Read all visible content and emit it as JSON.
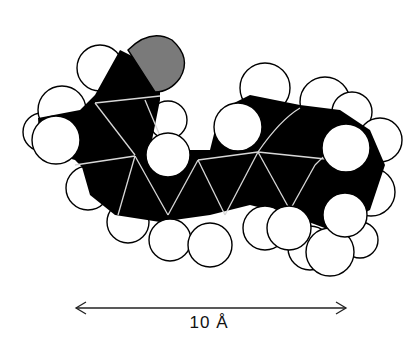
{
  "diagram": {
    "type": "space-filling molecular model",
    "atom_colors": {
      "carbon": "#000000",
      "hydrogen": "#ffffff",
      "oxygen": "#7a7a7a",
      "outline": "#000000",
      "bond_lines": "#d8d8d8"
    },
    "scale_bar": {
      "label": "10 Å",
      "arrow": "double-headed"
    }
  }
}
